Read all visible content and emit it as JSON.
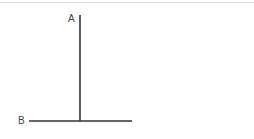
{
  "diagram": {
    "labels": {
      "a": "A",
      "b": "B"
    },
    "line_color": "#333333",
    "border_color": "#dcdcdc",
    "lines": {
      "vertical": {
        "x": 80,
        "y1": 15,
        "y2": 121
      },
      "horizontal": {
        "y": 121,
        "x1": 29,
        "x2": 132
      }
    }
  }
}
